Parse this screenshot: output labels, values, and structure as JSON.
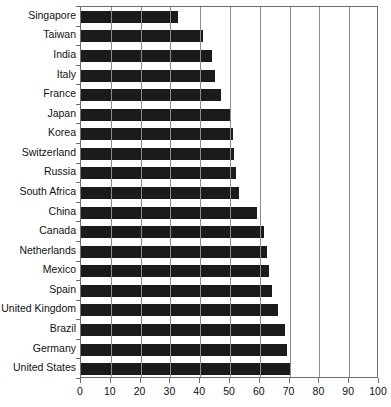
{
  "chart_data": {
    "type": "bar",
    "orientation": "horizontal",
    "title": "",
    "xlabel": "",
    "ylabel": "",
    "xlim": [
      0,
      100
    ],
    "xticks": [
      0,
      10,
      20,
      30,
      40,
      50,
      60,
      70,
      80,
      90,
      100
    ],
    "grid": true,
    "legend": false,
    "bar_color": "#1b1b1b",
    "categories": [
      "Singapore",
      "Taiwan",
      "India",
      "Italy",
      "France",
      "Japan",
      "Korea",
      "Switzerland",
      "Russia",
      "South Africa",
      "China",
      "Canada",
      "Netherlands",
      "Mexico",
      "Spain",
      "United Kingdom",
      "Brazil",
      "Germany",
      "United States"
    ],
    "values": [
      32.5,
      41.0,
      44.0,
      45.0,
      47.0,
      50.0,
      51.0,
      51.5,
      52.0,
      53.0,
      59.0,
      61.5,
      62.5,
      63.0,
      64.0,
      66.0,
      68.5,
      69.0,
      70.0
    ],
    "tick_labels": [
      "0",
      "10",
      "20",
      "30",
      "40",
      "50",
      "60",
      "70",
      "80",
      "90",
      "100"
    ],
    "title_remnant": ""
  }
}
